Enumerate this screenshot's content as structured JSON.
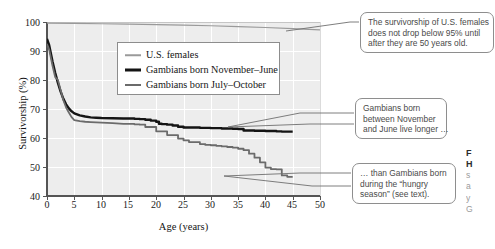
{
  "figure": {
    "axis": {
      "ylabel": "Survivorship (%)",
      "xlabel": "Age (years)",
      "yticks": [
        "100",
        "90",
        "80",
        "70",
        "60",
        "50",
        "40"
      ],
      "xticks": [
        "0",
        "5",
        "10",
        "15",
        "20",
        "25",
        "30",
        "35",
        "40",
        "45",
        "50"
      ]
    },
    "legend": {
      "items": [
        {
          "label": "U.S. females",
          "swatch": "line-thin-light-gray",
          "color": "#9a9a9a"
        },
        {
          "label": "Gambians born November–June",
          "swatch": "line-thick-black",
          "color": "#141414"
        },
        {
          "label": "Gambians born July–October",
          "swatch": "line-medium-gray",
          "color": "#6b6b6b"
        }
      ]
    },
    "callouts": [
      {
        "id": "usf",
        "lines": [
          "The survivorship of U.S. females",
          "does not drop below 95% until",
          "after they are 50 years old."
        ]
      },
      {
        "id": "nov",
        "lines": [
          "Gambians born",
          "between November",
          "and June live longer …"
        ]
      },
      {
        "id": "jul",
        "lines": [
          "… than Gambians born",
          "during the “hungry",
          "season” (see text)."
        ]
      }
    ],
    "caption_fragment": {
      "bold_lines": [
        "F",
        "H"
      ],
      "body_lines": [
        "s",
        "a",
        "y",
        "G"
      ]
    },
    "colors": {
      "plot_background": "#ededed",
      "gridline": "#ffffff",
      "axis": "#5a5a5a",
      "us_females": "#9a9a9a",
      "gambians_nov_june": "#141414",
      "gambians_july_oct": "#6b6b6b",
      "callout_border": "#8e8e8e",
      "callout_text": "#4a4a4a"
    }
  },
  "chart_data": {
    "type": "line",
    "title": "",
    "xlabel": "Age (years)",
    "ylabel": "Survivorship (%)",
    "xlim": [
      0,
      50
    ],
    "ylim": [
      40,
      100
    ],
    "xticks": [
      0,
      5,
      10,
      15,
      20,
      25,
      30,
      35,
      40,
      45,
      50
    ],
    "yticks": [
      40,
      50,
      60,
      70,
      80,
      90,
      100
    ],
    "grid": true,
    "legend_position": "upper-center-inside",
    "series": [
      {
        "name": "U.S. females",
        "color": "#9a9a9a",
        "linewidth": 1.2,
        "x": [
          0,
          5,
          10,
          15,
          20,
          25,
          30,
          35,
          40,
          45,
          50
        ],
        "y": [
          99.6,
          99.5,
          99.4,
          99.3,
          99.1,
          98.9,
          98.7,
          98.4,
          98.1,
          97.7,
          97.3
        ]
      },
      {
        "name": "Gambians born November–June",
        "color": "#141414",
        "linewidth": 2.4,
        "x": [
          0,
          0.4,
          1,
          1.5,
          2,
          2.5,
          3,
          3.5,
          4,
          4.5,
          5,
          6,
          7,
          8,
          9,
          10,
          12,
          14,
          16,
          17,
          18,
          19,
          20,
          20.5,
          21,
          22,
          23,
          24,
          25,
          28,
          30,
          32,
          34,
          35,
          36,
          38,
          40,
          42,
          43,
          45
        ],
        "y": [
          94.2,
          92.0,
          86.5,
          82.5,
          79.0,
          76.0,
          73.5,
          71.6,
          70.2,
          69.2,
          68.5,
          67.8,
          67.4,
          67.1,
          67.0,
          66.9,
          66.8,
          66.7,
          66.6,
          66.5,
          66.3,
          66.0,
          65.6,
          64.9,
          64.8,
          64.6,
          64.3,
          63.9,
          63.6,
          63.5,
          63.4,
          63.3,
          63.2,
          63.1,
          62.6,
          62.5,
          62.4,
          62.3,
          62.2,
          62.2
        ]
      },
      {
        "name": "Gambians born July–October",
        "color": "#6b6b6b",
        "linewidth": 1.8,
        "x": [
          0,
          0.4,
          1,
          1.5,
          2,
          2.5,
          3,
          3.5,
          4,
          4.5,
          5,
          6,
          7,
          8,
          9,
          10,
          12,
          14,
          16,
          17,
          18,
          20,
          22,
          24,
          25,
          26,
          28,
          29,
          30,
          31,
          32,
          33,
          34,
          35,
          36,
          37,
          38,
          39,
          40,
          41,
          42,
          43,
          44,
          45
        ],
        "y": [
          92.4,
          90.5,
          85.0,
          81.0,
          80.0,
          76.5,
          73.0,
          70.5,
          68.8,
          67.2,
          66.2,
          65.8,
          65.6,
          65.5,
          65.4,
          65.3,
          65.1,
          64.9,
          64.7,
          64.6,
          63.8,
          62.3,
          61.0,
          59.8,
          59.2,
          58.6,
          57.9,
          57.6,
          57.5,
          57.3,
          57.1,
          56.9,
          56.7,
          56.3,
          55.8,
          54.6,
          53.2,
          51.6,
          49.8,
          49.3,
          49.2,
          47.1,
          46.6,
          46.6
        ]
      }
    ]
  }
}
